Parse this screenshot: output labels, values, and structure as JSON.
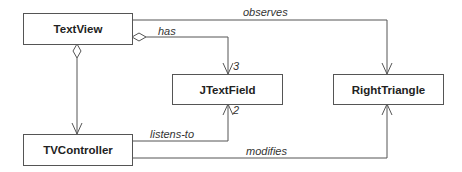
{
  "classes": {
    "textview": "TextView",
    "jtextfield": "JTextField",
    "righttriangle": "RightTriangle",
    "tvcontroller": "TVController"
  },
  "relations": {
    "observes": "observes",
    "has": "has",
    "has_multiplicity": "3",
    "listens_to": "listens-to",
    "listens_to_multiplicity": "2",
    "modifies": "modifies"
  },
  "colors": {
    "line": "#555555",
    "text": "#222222"
  }
}
